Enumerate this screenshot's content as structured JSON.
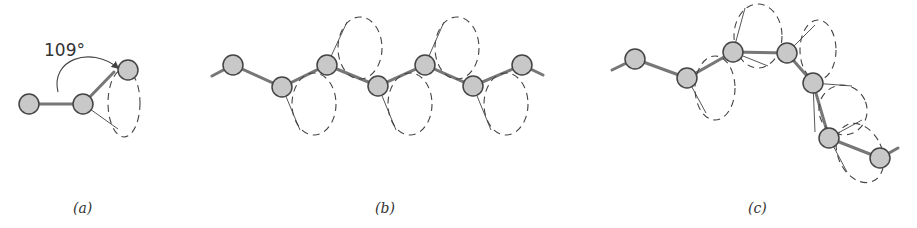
{
  "figure": {
    "angle_label": "109°",
    "panels": [
      {
        "id": "a",
        "label": "(a)",
        "description": "Three atoms, one bond rotation cone"
      },
      {
        "id": "b",
        "label": "(b)",
        "description": "Planar zigzag (all-trans) chain with rotation cones"
      },
      {
        "id": "c",
        "label": "(c)",
        "description": "Chain with rotations about bonds giving random coil conformation"
      }
    ]
  },
  "colors": {
    "atom_fill": "#c8c8c8",
    "atom_stroke": "#444444",
    "bond": "#777777",
    "cone": "#444444",
    "background": "#ffffff"
  }
}
